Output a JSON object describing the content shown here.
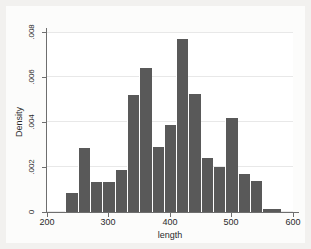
{
  "figure": {
    "background_color": "#f2f1ef",
    "plot_background_color": "#ffffff",
    "bar_color": "#595959",
    "grid_color": "#e8e8e8",
    "axis_color": "#6e6e6e"
  },
  "chart_data": {
    "type": "bar",
    "title": "",
    "subtitle": "",
    "xlabel": "length",
    "ylabel": "Density",
    "xlim": [
      200,
      600
    ],
    "ylim": [
      0,
      0.008
    ],
    "grid": true,
    "legend": null,
    "x_tick_labels": [
      "200",
      "300",
      "400",
      "500",
      "600"
    ],
    "x_tick_values": [
      200,
      300,
      400,
      500,
      600
    ],
    "y_tick_labels": [
      "0",
      ".002",
      ".004",
      ".006",
      ".008"
    ],
    "y_tick_values": [
      0,
      0.002,
      0.004,
      0.006,
      0.008
    ],
    "bin_width": 20,
    "bins": [
      {
        "x0": 230,
        "x1": 250,
        "value": 0.00085
      },
      {
        "x0": 250,
        "x1": 270,
        "value": 0.00285
      },
      {
        "x0": 270,
        "x1": 290,
        "value": 0.00135
      },
      {
        "x0": 290,
        "x1": 310,
        "value": 0.00135
      },
      {
        "x0": 310,
        "x1": 330,
        "value": 0.00185
      },
      {
        "x0": 330,
        "x1": 350,
        "value": 0.0052
      },
      {
        "x0": 350,
        "x1": 370,
        "value": 0.0064
      },
      {
        "x0": 370,
        "x1": 390,
        "value": 0.0029
      },
      {
        "x0": 390,
        "x1": 410,
        "value": 0.00385
      },
      {
        "x0": 410,
        "x1": 430,
        "value": 0.0077
      },
      {
        "x0": 430,
        "x1": 450,
        "value": 0.00525
      },
      {
        "x0": 450,
        "x1": 470,
        "value": 0.0024
      },
      {
        "x0": 470,
        "x1": 490,
        "value": 0.002
      },
      {
        "x0": 490,
        "x1": 510,
        "value": 0.0042
      },
      {
        "x0": 510,
        "x1": 530,
        "value": 0.0017
      },
      {
        "x0": 530,
        "x1": 550,
        "value": 0.0014
      },
      {
        "x0": 550,
        "x1": 580,
        "value": 0.00015
      }
    ],
    "categories": [
      "230-250",
      "250-270",
      "270-290",
      "290-310",
      "310-330",
      "330-350",
      "350-370",
      "370-390",
      "390-410",
      "410-430",
      "430-450",
      "450-470",
      "470-490",
      "490-510",
      "510-530",
      "530-550",
      "550-580"
    ],
    "values": [
      0.00085,
      0.00285,
      0.00135,
      0.00135,
      0.00185,
      0.0052,
      0.0064,
      0.0029,
      0.00385,
      0.0077,
      0.00525,
      0.0024,
      0.002,
      0.0042,
      0.0017,
      0.0014,
      0.00015
    ]
  }
}
